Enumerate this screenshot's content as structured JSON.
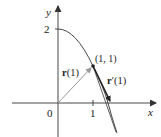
{
  "figure": {
    "axes": {
      "x_label": "x",
      "y_label": "y",
      "origin_label": "0",
      "x_tick_label": "1",
      "y_tick_label": "2"
    },
    "curve": {
      "description": "plane curve passing through (0,2) and (1,1)",
      "color": "#333333"
    },
    "point": {
      "label": "(1, 1)"
    },
    "position_vector": {
      "label_bold": "r",
      "label_rest": "(1)",
      "color": "#999999"
    },
    "tangent_vector": {
      "label_bold": "r",
      "label_rest": "′(1)",
      "color": "#333333"
    }
  }
}
